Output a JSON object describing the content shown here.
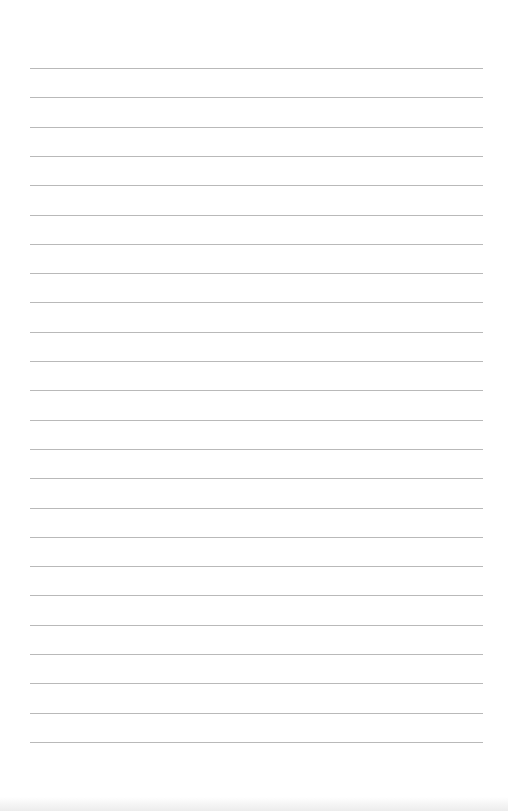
{
  "page": {
    "type": "lined-paper",
    "background_color": "#ffffff",
    "line_color": "#b9b9b9",
    "line_count": 24,
    "first_line_y": 68,
    "line_spacing": 29.3,
    "line_left": 30,
    "line_width": 453
  }
}
